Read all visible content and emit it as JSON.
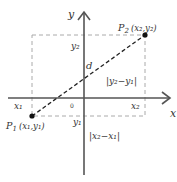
{
  "diagram": {
    "axes": {
      "x_label": "x",
      "y_label": "y",
      "origin_label": "0"
    },
    "points": {
      "p1": {
        "name": "P",
        "sub": "1",
        "coords": "(x₁,y₁)"
      },
      "p2": {
        "name": "P",
        "sub": "2",
        "coords": "(x₂,y₂)"
      }
    },
    "labels": {
      "x1": "x₁",
      "x2": "x₂",
      "y1": "y₁",
      "y2": "y₂",
      "d": "d",
      "dy": "|y₂−y₁|",
      "dx": "|x₂−x₁|"
    },
    "colors": {
      "axis": "#555555",
      "dashed": "#999999",
      "segment": "#222222"
    }
  }
}
